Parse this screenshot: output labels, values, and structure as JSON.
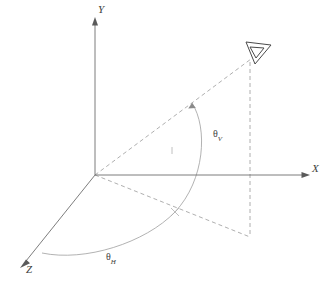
{
  "figure": {
    "kind": "3d-coordinate-angle-diagram",
    "background_color": "#ffffff",
    "line_color": "#6e6e6e",
    "dashed_color": "#9a9a9a",
    "arc_color": "#9e9e9e",
    "label_color": "#3d3d3d",
    "width": 329,
    "height": 281
  },
  "axes": {
    "y": {
      "label": "Y",
      "origin": [
        95,
        175
      ],
      "tip": [
        95,
        22
      ],
      "direction": "up"
    },
    "x": {
      "label": "X",
      "origin": [
        95,
        175
      ],
      "tip": [
        305,
        175
      ],
      "direction": "right"
    },
    "z": {
      "label": "Z",
      "origin": [
        95,
        175
      ],
      "tip": [
        22,
        265
      ],
      "direction": "down-left"
    }
  },
  "viewer": {
    "icon": "eye-triangle-icon",
    "position": [
      258,
      52
    ]
  },
  "construction_lines": [
    {
      "name": "sight-ray",
      "from": [
        95,
        175
      ],
      "to": [
        252,
        58
      ],
      "style": "dashed"
    },
    {
      "name": "vertical-drop",
      "from": [
        250,
        60
      ],
      "to": [
        250,
        237
      ],
      "style": "dashed"
    },
    {
      "name": "ground-projection",
      "from": [
        95,
        175
      ],
      "to": [
        250,
        237
      ],
      "style": "dashed"
    }
  ],
  "angles": {
    "vertical": {
      "symbol": "θ",
      "subscript": "V",
      "arc_from": [
        193,
        103
      ],
      "arc_to": [
        175,
        212
      ],
      "label_position": [
        213,
        129
      ]
    },
    "horizontal": {
      "symbol": "θ",
      "subscript": "H",
      "arc_from": [
        42,
        253
      ],
      "arc_to": [
        175,
        212
      ],
      "label_position": [
        106,
        252
      ]
    }
  },
  "markers": {
    "intersection_point": [
      175,
      212
    ],
    "mid_tick": [
      172,
      150
    ]
  }
}
